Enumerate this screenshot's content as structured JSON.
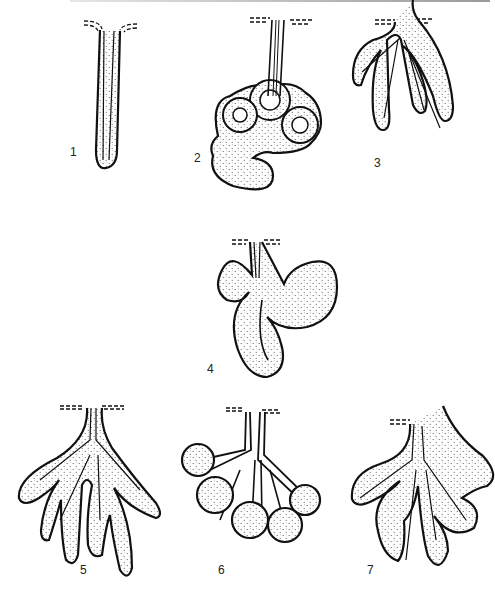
{
  "figure": {
    "title": "",
    "panels": [
      {
        "id": 1,
        "label": "1",
        "description": "simple unbranched tubular gland"
      },
      {
        "id": 2,
        "label": "2",
        "description": "simple coiled tubular gland"
      },
      {
        "id": 3,
        "label": "3",
        "description": "simple branched tubular gland"
      },
      {
        "id": 4,
        "label": "4",
        "description": "simple branched acinar / saccular gland"
      },
      {
        "id": 5,
        "label": "5",
        "description": "compound tubular gland"
      },
      {
        "id": 6,
        "label": "6",
        "description": "compound acinar gland"
      },
      {
        "id": 7,
        "label": "7",
        "description": "compound tubuloacinar gland"
      }
    ],
    "colors": {
      "ink": "#111111",
      "fill": "#e9e9e9",
      "stipple": "#555555",
      "background": "#ffffff"
    }
  }
}
